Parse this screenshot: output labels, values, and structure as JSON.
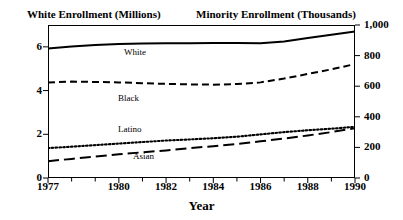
{
  "chart_data": {
    "type": "line",
    "title": "",
    "left_axis_title": "White Enrollment (Millions)",
    "right_axis_title": "Minority Enrollment (Thousands)",
    "xlabel": "Year",
    "grid": false,
    "legend_position": "inline-labels",
    "x": [
      1977,
      1978,
      1979,
      1980,
      1981,
      1982,
      1983,
      1984,
      1985,
      1986,
      1987,
      1988,
      1989,
      1990
    ],
    "xlim": [
      1977,
      1990
    ],
    "xticks_major": [
      1977,
      1980,
      1982,
      1984,
      1986,
      1988,
      1990
    ],
    "xtick_labels": [
      "1977",
      "1980",
      "1982",
      "1984",
      "1986",
      "1988",
      "1990"
    ],
    "left_ylim": [
      0,
      7
    ],
    "left_yticks": [
      0,
      2,
      4,
      6
    ],
    "left_ytick_labels": [
      "0",
      "2",
      "4",
      "6"
    ],
    "right_ylim": [
      0,
      1000
    ],
    "right_yticks": [
      0,
      200,
      400,
      600,
      800,
      1000
    ],
    "right_ytick_labels": [
      "0",
      "200",
      "400",
      "600",
      "800",
      "1,000"
    ],
    "series": [
      {
        "name": "White",
        "axis": "left",
        "style": "solid",
        "units": "millions",
        "values": [
          5.93,
          6.02,
          6.08,
          6.13,
          6.15,
          6.16,
          6.17,
          6.18,
          6.18,
          6.16,
          6.25,
          6.4,
          6.55,
          6.7
        ]
      },
      {
        "name": "Black",
        "axis": "right",
        "style": "dashed",
        "units": "thousands",
        "values": [
          625,
          630,
          628,
          625,
          620,
          615,
          612,
          610,
          614,
          625,
          650,
          680,
          710,
          745
        ]
      },
      {
        "name": "Latino",
        "axis": "right",
        "style": "dotted",
        "units": "thousands",
        "values": [
          195,
          205,
          215,
          225,
          235,
          245,
          252,
          260,
          270,
          285,
          300,
          312,
          322,
          335
        ]
      },
      {
        "name": "Asian",
        "axis": "right",
        "style": "long-dash",
        "units": "thousands",
        "values": [
          110,
          125,
          140,
          155,
          168,
          180,
          195,
          208,
          222,
          240,
          258,
          278,
          300,
          325
        ]
      }
    ]
  }
}
